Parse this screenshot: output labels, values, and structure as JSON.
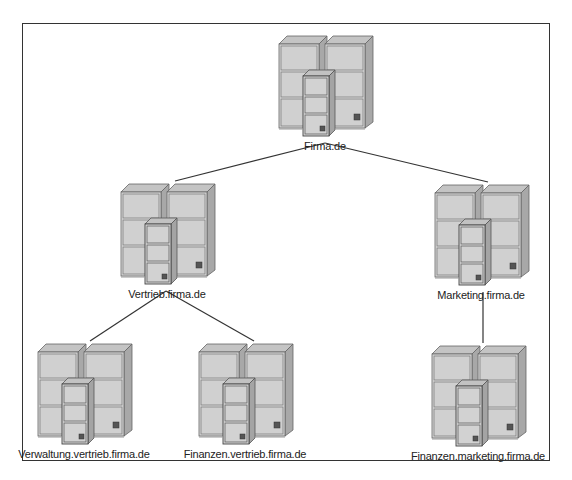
{
  "diagram": {
    "type": "hierarchy",
    "title": "",
    "colors": {
      "cabinet_face": "#d4d4d4",
      "cabinet_top": "#bdbdbd",
      "cabinet_side": "#a9a9a9",
      "cabinet_outline": "#555555",
      "connector": "#333333",
      "frame": "#333333"
    },
    "nodes": [
      {
        "id": "root",
        "label": "Firma.de",
        "icon": "server-cabinet-icon"
      },
      {
        "id": "vertrieb",
        "label": "Vertrieb.firma.de",
        "icon": "server-cabinet-icon",
        "parent": "root"
      },
      {
        "id": "marketing",
        "label": "Marketing.firma.de",
        "icon": "server-cabinet-icon",
        "parent": "root"
      },
      {
        "id": "verwaltung-vertrieb",
        "label": "Verwaltung.vertrieb.firma.de",
        "icon": "server-cabinet-icon",
        "parent": "vertrieb"
      },
      {
        "id": "finanzen-vertrieb",
        "label": "Finanzen.vertrieb.firma.de",
        "icon": "server-cabinet-icon",
        "parent": "vertrieb"
      },
      {
        "id": "finanzen-marketing",
        "label": "Finanzen.marketing.firma.de",
        "icon": "server-cabinet-icon",
        "parent": "marketing"
      }
    ],
    "edges": [
      {
        "from": "root",
        "to": "vertrieb"
      },
      {
        "from": "root",
        "to": "marketing"
      },
      {
        "from": "vertrieb",
        "to": "verwaltung-vertrieb"
      },
      {
        "from": "vertrieb",
        "to": "finanzen-vertrieb"
      },
      {
        "from": "marketing",
        "to": "finanzen-marketing"
      }
    ]
  }
}
